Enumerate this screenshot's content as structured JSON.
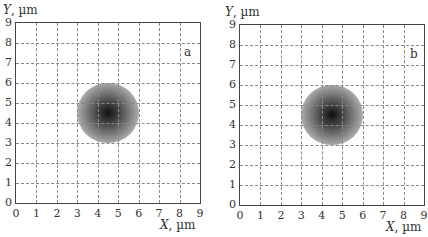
{
  "chart_data": [
    {
      "type": "heatmap",
      "panel_label": "a",
      "title": "",
      "xlabel": "X, µm",
      "ylabel": "Y, µm",
      "xlim": [
        0,
        9
      ],
      "ylim": [
        0,
        9
      ],
      "xticks": [
        "0",
        "1",
        "2",
        "3",
        "4",
        "5",
        "6",
        "7",
        "8",
        "9"
      ],
      "yticks": [
        "0",
        "1",
        "2",
        "3",
        "4",
        "5",
        "6",
        "7",
        "8",
        "9"
      ],
      "grid": true,
      "grid_style": "dashed",
      "spot": {
        "center_x": 4.5,
        "center_y": 4.5,
        "radius_x": 1.5,
        "radius_y": 1.5,
        "peak_color": "#111111"
      }
    },
    {
      "type": "heatmap",
      "panel_label": "b",
      "title": "",
      "xlabel": "X, µm",
      "ylabel": "Y, µm",
      "xlim": [
        0,
        9
      ],
      "ylim": [
        0,
        9
      ],
      "xticks": [
        "0",
        "1",
        "2",
        "3",
        "4",
        "5",
        "6",
        "7",
        "8",
        "9"
      ],
      "yticks": [
        "0",
        "1",
        "2",
        "3",
        "4",
        "5",
        "6",
        "7",
        "8",
        "9"
      ],
      "grid": true,
      "grid_style": "dashed",
      "spot": {
        "center_x": 4.5,
        "center_y": 4.5,
        "radius_x": 1.5,
        "radius_y": 1.5,
        "peak_color": "#0a0a0a"
      }
    }
  ],
  "panels": [
    {
      "tag": "a",
      "xlabel_var": "X",
      "xlabel_unit": ", µm",
      "ylabel_var": "Y",
      "ylabel_unit": ", µm"
    },
    {
      "tag": "b",
      "xlabel_var": "X",
      "xlabel_unit": ", µm",
      "ylabel_var": "Y",
      "ylabel_unit": ", µm"
    }
  ]
}
